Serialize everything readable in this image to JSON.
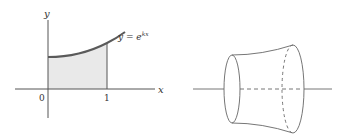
{
  "left_figure": {
    "axis_x_label": "x",
    "axis_y_label": "y",
    "origin_label": "0",
    "tick_label_1": "1",
    "curve_label_prefix": "y = e",
    "curve_label_exponent": "kx",
    "curve_color": "#5a5a5a",
    "fill_color": "#e8e8e8"
  },
  "right_figure": {
    "description": "solid of revolution about x-axis"
  }
}
